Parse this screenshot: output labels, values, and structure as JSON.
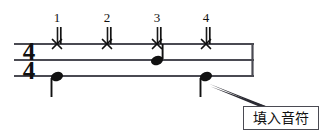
{
  "figure": {
    "type": "drum-notation-exercise",
    "time_signature": {
      "numerator": "4",
      "denominator": "4",
      "display": "4/4"
    },
    "beat_numbers": [
      {
        "label": "1",
        "x": 57
      },
      {
        "label": "2",
        "x": 107
      },
      {
        "label": "3",
        "x": 157
      },
      {
        "label": "4",
        "x": 206
      }
    ],
    "staff": {
      "line_count": 3,
      "line_y": [
        44,
        60,
        76
      ],
      "left_x": 14,
      "right_x": 253,
      "barline_right_x": 253
    },
    "notes": {
      "hi_hat": {
        "notehead": "x-notehead",
        "line": "top",
        "beats": [
          "1",
          "2",
          "3",
          "4"
        ],
        "x": [
          57,
          107,
          157,
          206
        ],
        "stem_direction": "up"
      },
      "snare": {
        "notehead": "filled-notehead",
        "line": "middle",
        "beats": [
          "3"
        ],
        "x": [
          157
        ],
        "stem_direction": "up"
      },
      "bass": {
        "notehead": "filled-notehead",
        "line": "bottom",
        "beats": [
          "1",
          "4"
        ],
        "x": [
          57,
          206
        ],
        "stem_direction": "down"
      }
    },
    "callout": {
      "label": "填入音符",
      "box": {
        "x": 243,
        "y": 106,
        "width": 76,
        "height": 24
      },
      "leader_from": {
        "x": 243,
        "y": 112
      },
      "leader_to": {
        "x": 209,
        "y": 84
      }
    },
    "colors": {
      "ink": "#111111",
      "staff_line": "#4a4a52",
      "box_border": "#4a4a52",
      "background": "#ffffff"
    }
  }
}
